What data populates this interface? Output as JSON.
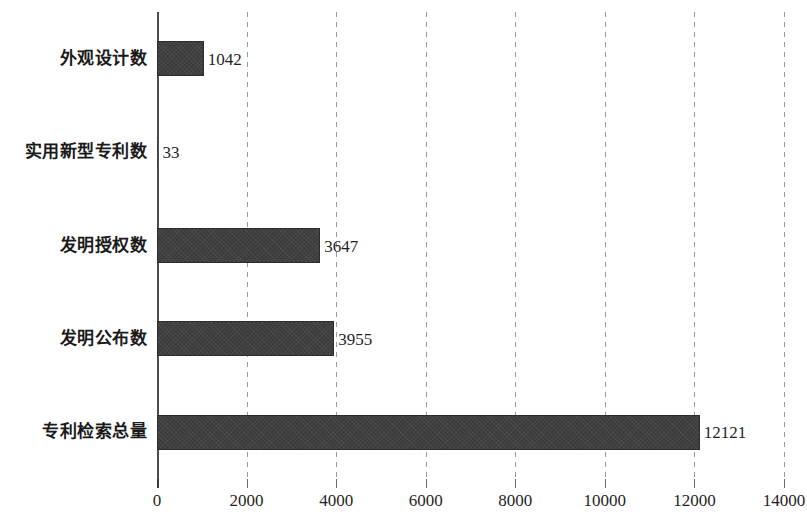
{
  "chart_data": {
    "type": "bar",
    "orientation": "horizontal",
    "title": "",
    "subtitle": "",
    "xlabel": "",
    "ylabel": "",
    "categories": [
      "外观设计数",
      "实用新型专利数",
      "发明授权数",
      "发明公布数",
      "专利检索总量"
    ],
    "values": [
      1042,
      33,
      3647,
      3955,
      12121
    ],
    "value_labels": [
      "1042",
      "33",
      "3647",
      "3955",
      "12121"
    ],
    "xlim": [
      0,
      14000
    ],
    "xticks": [
      0,
      2000,
      4000,
      6000,
      8000,
      10000,
      12000,
      14000
    ],
    "xtick_labels": [
      "0",
      "2000",
      "4000",
      "6000",
      "8000",
      "10000",
      "12000",
      "14000"
    ],
    "grid": "vertical-dashed",
    "legend": null,
    "legend_position": "none",
    "series": [
      {
        "name": "",
        "values": [
          1042,
          33,
          3647,
          3955,
          12121
        ]
      }
    ],
    "colors": {
      "bar_fill": "#3b3b3b",
      "bar_border": "#2c2c2c",
      "gridline": "#9a9a9a",
      "axis": "#4d4d4d",
      "text": "#1a1a1a",
      "background": "#ffffff"
    }
  }
}
